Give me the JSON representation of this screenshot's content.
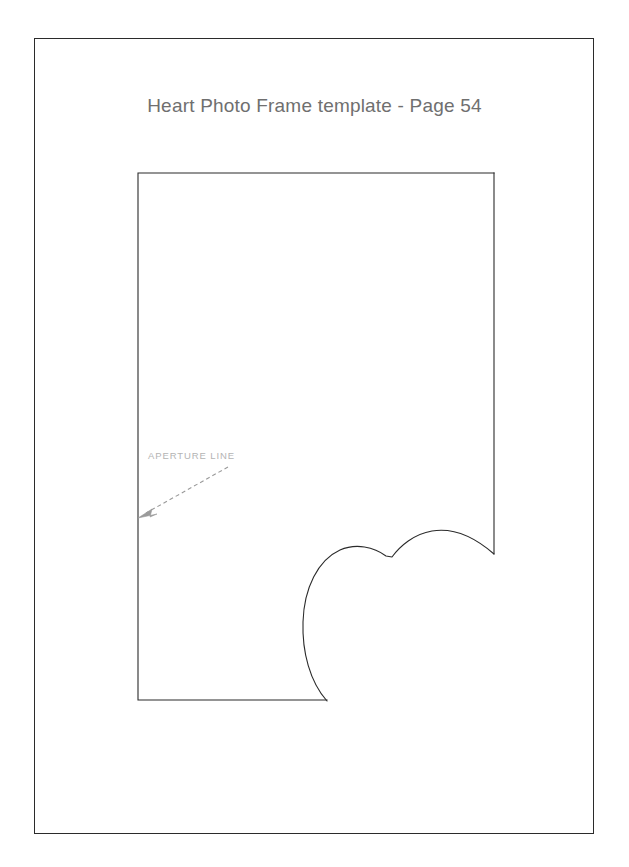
{
  "page": {
    "background_color": "#ffffff",
    "border_color": "#2b2b2b",
    "width": 629,
    "height": 867
  },
  "title": {
    "text": "Heart Photo Frame template - Page 54",
    "color": "#6f6f6f"
  },
  "annotation": {
    "label": "APERTURE LINE",
    "label_color": "#b4b4b4",
    "arrow_color": "#9a9a9a",
    "arrow_style": "dashed",
    "arrow_from": [
      230,
      466
    ],
    "arrow_to": [
      139,
      517
    ]
  },
  "template": {
    "name": "heart-photo-frame-template",
    "outline_color": "#2b2b2b",
    "rect": {
      "left": 138,
      "top": 173,
      "right": 494,
      "bottom": 700
    },
    "heart_aperture": {
      "description": "Partial heart curve forming the aperture cut line inside the template rectangle",
      "bottom_point": [
        327,
        701
      ],
      "left_extreme": [
        303,
        620
      ],
      "left_lobe_peak": [
        365,
        550
      ],
      "cleft": [
        392,
        557
      ],
      "right_lobe_peak": [
        448,
        533
      ],
      "right_edge_meet": [
        494,
        554
      ]
    }
  }
}
